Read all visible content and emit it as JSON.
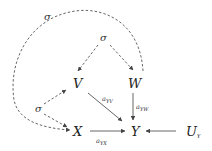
{
  "diagram": {
    "type": "causal-graph",
    "nodes": {
      "V": {
        "label": "V"
      },
      "W": {
        "label": "W"
      },
      "X": {
        "label": "X"
      },
      "Y": {
        "label": "Y"
      },
      "UY": {
        "label": "U",
        "sub": "Y"
      }
    },
    "confounders": {
      "top": {
        "label": "σ"
      },
      "mid": {
        "label": "σ"
      },
      "left": {
        "label": "σ"
      }
    },
    "edge_labels": {
      "aYV": {
        "label": "a",
        "sub": "YV"
      },
      "aYW": {
        "label": "a",
        "sub": "YW"
      },
      "aYX": {
        "label": "a",
        "sub": "YX"
      }
    },
    "edges": [
      {
        "from": "V",
        "to": "Y",
        "style": "solid",
        "label": "aYV"
      },
      {
        "from": "W",
        "to": "Y",
        "style": "solid",
        "label": "aYW"
      },
      {
        "from": "X",
        "to": "Y",
        "style": "solid",
        "label": "aYX"
      },
      {
        "from": "UY",
        "to": "Y",
        "style": "solid"
      },
      {
        "from": "σ(mid)",
        "to": [
          "V",
          "W"
        ],
        "style": "dashed"
      },
      {
        "from": "σ(left)",
        "to": [
          "V",
          "X"
        ],
        "style": "dashed"
      },
      {
        "from": "σ(top)",
        "to": [
          "W",
          "X"
        ],
        "style": "dashed-arc"
      }
    ],
    "colors": {
      "line": "#555555",
      "text": "#222222"
    }
  }
}
